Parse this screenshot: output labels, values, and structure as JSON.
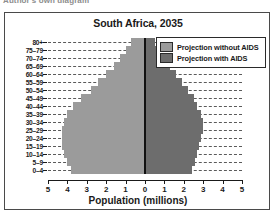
{
  "caption": {
    "text": "Author's own diagram"
  },
  "figure": {
    "title": "South Africa, 2035",
    "xlabel": "Population (millions)"
  },
  "legend": {
    "items": [
      {
        "label": "Projection without AIDS",
        "color": "#9b9b9b"
      },
      {
        "label": "Projection with AIDS",
        "color": "#6d6d6d"
      }
    ]
  },
  "colors": {
    "without_aids": "#9b9b9b",
    "with_aids": "#6d6d6d",
    "axis": "#111111",
    "frame": "#4a4a4a",
    "grid": "#5a5a5a"
  },
  "chart_data": {
    "type": "bar",
    "subtype": "population-pyramid",
    "title": "South Africa, 2035",
    "xlabel": "Population (millions)",
    "ylabel": "",
    "grid": true,
    "legend_position": "top-right",
    "xlim": [
      -5,
      5
    ],
    "xticks": [
      5,
      4,
      3,
      2,
      1,
      0,
      1,
      2,
      3,
      4,
      5
    ],
    "xtick_values": [
      -5,
      -4,
      -3,
      -2,
      -1,
      0,
      1,
      2,
      3,
      4,
      5
    ],
    "categories": [
      "80+",
      "75–79",
      "70–74",
      "65–69",
      "60–64",
      "55–59",
      "50–54",
      "45–49",
      "40–44",
      "35–39",
      "30–34",
      "25–29",
      "20–24",
      "15–19",
      "10–14",
      "5–9",
      "0–4"
    ],
    "series": [
      {
        "name": "Projection without AIDS",
        "side": "left",
        "color": "#9b9b9b",
        "values": [
          0.7,
          1.0,
          1.3,
          1.6,
          2.0,
          2.4,
          2.8,
          3.3,
          3.7,
          4.0,
          4.2,
          4.3,
          4.3,
          4.3,
          4.2,
          4.0,
          3.8
        ]
      },
      {
        "name": "Projection with AIDS",
        "side": "right",
        "color": "#6d6d6d",
        "values": [
          0.5,
          0.8,
          1.0,
          1.3,
          1.6,
          1.9,
          2.2,
          2.5,
          2.7,
          2.9,
          3.0,
          3.0,
          2.9,
          2.8,
          2.7,
          2.6,
          2.4
        ]
      }
    ]
  }
}
